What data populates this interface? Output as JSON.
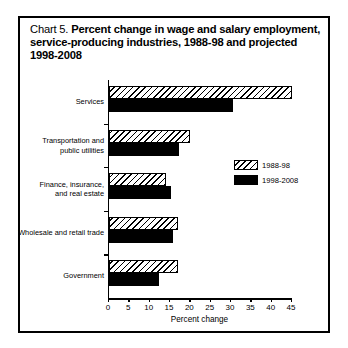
{
  "title": {
    "label": "Chart 5.",
    "text": "Percent change in wage and salary employment, service-producing industries, 1988-98 and projected 1998-2008"
  },
  "legend": {
    "items": [
      {
        "name": "1988-98",
        "pattern": "hatched"
      },
      {
        "name": "1998-2008",
        "pattern": "solid"
      }
    ]
  },
  "axis": {
    "x_title": "Percent change",
    "ticks": [
      "0",
      "5",
      "10",
      "15",
      "20",
      "25",
      "30",
      "35",
      "40",
      "45"
    ]
  },
  "chart_data": {
    "type": "bar",
    "orientation": "horizontal",
    "title": "Chart 5. Percent change in wage and salary employment, service-producing industries, 1988-98 and projected 1998-2008",
    "xlabel": "Percent change",
    "ylabel": "",
    "xlim": [
      0,
      45
    ],
    "xticks": [
      0,
      5,
      10,
      15,
      20,
      25,
      30,
      35,
      40,
      45
    ],
    "grid": false,
    "legend_position": "middle-right",
    "categories": [
      "Services",
      "Transportation and public utilities",
      "Finance, insurance, and real estate",
      "Wholesale and retail trade",
      "Government"
    ],
    "series": [
      {
        "name": "1988-98",
        "color": "#ffffff",
        "pattern": "diagonal-hatch",
        "values": [
          45.0,
          20.0,
          14.0,
          17.0,
          17.0
        ]
      },
      {
        "name": "1998-2008",
        "color": "#000000",
        "pattern": "solid",
        "values": [
          30.5,
          17.3,
          15.3,
          15.8,
          12.3
        ]
      }
    ]
  },
  "categories_display": [
    "Services",
    "Transportation and\npublic utilities",
    "Finance, insurance,\nand real estate",
    "Wholesale and retail trade",
    "Government"
  ]
}
